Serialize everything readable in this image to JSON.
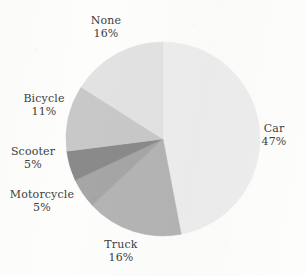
{
  "chart_data": {
    "type": "pie",
    "title": "",
    "subtitle": "",
    "xlabel": "",
    "ylabel": "",
    "legend_position": "none",
    "grid": false,
    "label_format": "name + percent",
    "start_angle_deg": 0,
    "direction": "clockwise",
    "categories": [
      "Car",
      "Truck",
      "Motorcycle",
      "Scooter",
      "Bicycle",
      "None"
    ],
    "values": [
      47,
      16,
      5,
      5,
      11,
      16
    ],
    "units": "percent",
    "colors": [
      "#ededed",
      "#b4b4b4",
      "#a6a6a6",
      "#8a8a8a",
      "#c8c8c8",
      "#e2e2e2"
    ],
    "slices": [
      {
        "name": "Car",
        "percent": 47,
        "percent_text": "47%",
        "color": "#ededed"
      },
      {
        "name": "Truck",
        "percent": 16,
        "percent_text": "16%",
        "color": "#b4b4b4"
      },
      {
        "name": "Motorcycle",
        "percent": 5,
        "percent_text": "5%",
        "color": "#a6a6a6"
      },
      {
        "name": "Scooter",
        "percent": 5,
        "percent_text": "5%",
        "color": "#8a8a8a"
      },
      {
        "name": "Bicycle",
        "percent": 11,
        "percent_text": "11%",
        "color": "#c8c8c8"
      },
      {
        "name": "None",
        "percent": 16,
        "percent_text": "16%",
        "color": "#e2e2e2"
      }
    ]
  },
  "figure": {
    "background_color": "#fdfdfc",
    "text_color": "#3d3d3d"
  },
  "labels": {
    "none": {
      "name": "None",
      "percent": "16%"
    },
    "car": {
      "name": "Car",
      "percent": "47%"
    },
    "truck": {
      "name": "Truck",
      "percent": "16%"
    },
    "bicycle": {
      "name": "Bicycle",
      "percent": "11%"
    },
    "scooter": {
      "name": "Scooter",
      "percent": "5%"
    },
    "motorcycle": {
      "name": "Motorcycle",
      "percent": "5%"
    }
  }
}
